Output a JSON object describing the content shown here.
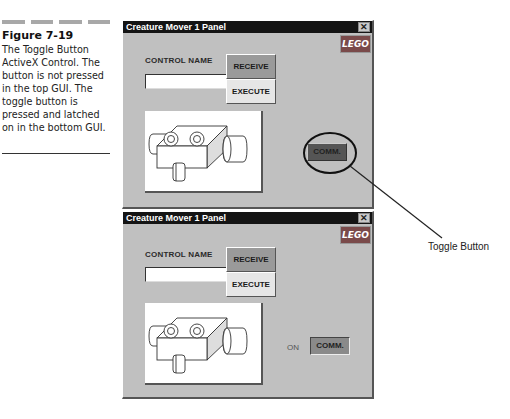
{
  "figure": {
    "number": "Figure 7-19",
    "caption": "The Toggle Button ActiveX Control. The button is not pressed in the top GUI. The toggle button is pressed and latched on in the bottom GUI."
  },
  "panels": [
    {
      "title": "Creature Mover 1 Panel",
      "close_glyph": "✕",
      "logo": "LEGO",
      "control_name_label": "CONTROL NAME",
      "control_name_value": "",
      "receive_label": "RECEIVE",
      "execute_label": "EXECUTE",
      "state_label": "OFF",
      "comm_label": "COMM.",
      "comm_pressed": false
    },
    {
      "title": "Creature Mover 1 Panel",
      "close_glyph": "✕",
      "logo": "LEGO",
      "control_name_label": "CONTROL NAME",
      "control_name_value": "",
      "receive_label": "RECEIVE",
      "execute_label": "EXECUTE",
      "state_label": "ON",
      "comm_label": "COMM.",
      "comm_pressed": true
    }
  ],
  "callout": {
    "label": "Toggle Button"
  },
  "colors": {
    "panel_bg": "#c0c0c0",
    "titlebar": "#141414",
    "logo_bg": "#7a4a4a"
  }
}
